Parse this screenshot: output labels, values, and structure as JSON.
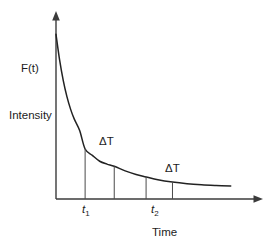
{
  "figure": {
    "background_color": "#ffffff",
    "width": 278,
    "height": 250,
    "axis_color": "#3b3b3b",
    "curve_color": "#222222",
    "drop_line_color": "#4a4a4a",
    "text_color": "#1c1c1c"
  },
  "labels": {
    "y_axis_curve_label": "F(t)",
    "y_axis_title": "Intensity",
    "x_axis_title": "Time",
    "delta_t_first": "ΔT",
    "delta_t_second": "ΔT",
    "tick_t1_base": "t",
    "tick_t1_sub": "1",
    "tick_t2_base": "t",
    "tick_t2_sub": "2"
  },
  "chart_data": {
    "type": "line",
    "title": "",
    "subtitle": "",
    "xlabel": "Time",
    "ylabel": "Intensity",
    "series_label": "F(t)",
    "grid": false,
    "legend": null,
    "axes_style": "arrowed-open",
    "xlim": [
      0,
      1
    ],
    "ylim": [
      0,
      1
    ],
    "x_tick_labels": [
      "t₁",
      "t₂"
    ],
    "x_tick_values": [
      0.16,
      0.495
    ],
    "y_tick_labels": [],
    "annotations": [
      {
        "text": "F(t)",
        "x": 0.0,
        "y": 0.73,
        "note": "curve identity label at top of y-axis"
      },
      {
        "text": "ΔT",
        "x": 0.235,
        "y": 0.345,
        "note": "interval between first pair of drop lines"
      },
      {
        "text": "ΔT",
        "x": 0.565,
        "y": 0.205,
        "note": "interval between second pair of drop lines"
      }
    ],
    "drop_lines": [
      {
        "label": "t₁",
        "x": 0.16,
        "y_curve": 0.281
      },
      {
        "label": "",
        "x": 0.32,
        "y_curve": 0.184
      },
      {
        "label": "t₂",
        "x": 0.495,
        "y_curve": 0.124
      },
      {
        "label": "",
        "x": 0.64,
        "y_curve": 0.095
      }
    ],
    "delta_t_spans": [
      {
        "from_x": 0.16,
        "to_x": 0.32,
        "label": "ΔT"
      },
      {
        "from_x": 0.495,
        "to_x": 0.64,
        "label": "ΔT"
      }
    ],
    "x": [
      0.0,
      0.02,
      0.04,
      0.06,
      0.08,
      0.1,
      0.13,
      0.16,
      0.2,
      0.24,
      0.28,
      0.32,
      0.38,
      0.44,
      0.495,
      0.56,
      0.64,
      0.72,
      0.8,
      0.88,
      0.96
    ],
    "y": [
      0.925,
      0.78,
      0.665,
      0.575,
      0.505,
      0.45,
      0.385,
      0.281,
      0.245,
      0.212,
      0.196,
      0.184,
      0.158,
      0.138,
      0.124,
      0.108,
      0.095,
      0.086,
      0.08,
      0.076,
      0.073
    ]
  }
}
